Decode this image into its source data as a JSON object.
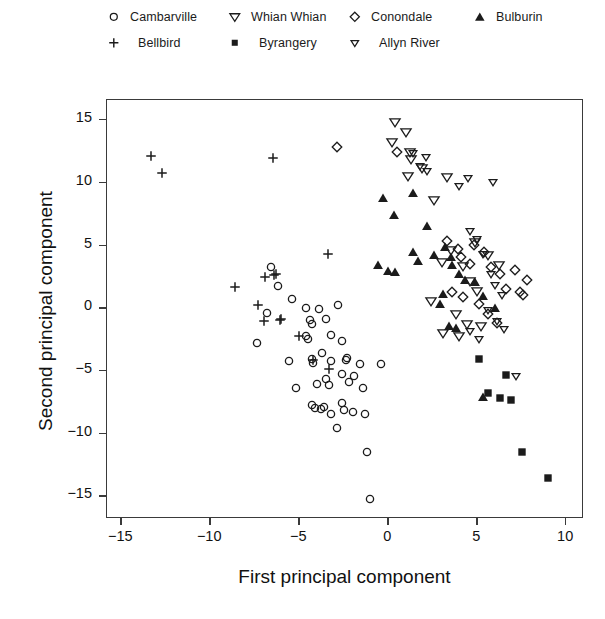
{
  "chart_data": {
    "type": "scatter",
    "title": "",
    "xlabel": "First principal component",
    "ylabel": "Second principal component",
    "xlim": [
      -15.8,
      11.0
    ],
    "ylim": [
      -16.8,
      16.6
    ],
    "xticks": [
      "-15",
      "-10",
      "-5",
      "0",
      "5",
      "10"
    ],
    "xtick_values": [
      -15,
      -10,
      -5,
      0,
      5,
      10
    ],
    "yticks": [
      "15",
      "10",
      "5",
      "0",
      "-5",
      "-10",
      "-15"
    ],
    "ytick_values": [
      15,
      10,
      5,
      0,
      -5,
      -10,
      -15
    ],
    "grid": false,
    "legend_position": "top",
    "series": [
      {
        "name": "Cambarville",
        "marker": "circle-open",
        "points": [
          [
            -6.6,
            3.1
          ],
          [
            -6.2,
            1.6
          ],
          [
            -5.4,
            0.6
          ],
          [
            -4.6,
            -0.1
          ],
          [
            -4.4,
            -1.1
          ],
          [
            -4.3,
            -1.4
          ],
          [
            -3.9,
            -0.2
          ],
          [
            -3.5,
            -1.0
          ],
          [
            -7.4,
            -2.9
          ],
          [
            -4.6,
            -2.4
          ],
          [
            -4.5,
            -2.6
          ],
          [
            -3.2,
            -2.3
          ],
          [
            -2.6,
            -2.8
          ],
          [
            -5.6,
            -4.4
          ],
          [
            -4.3,
            -4.2
          ],
          [
            -4.2,
            -4.5
          ],
          [
            -3.7,
            -3.7
          ],
          [
            -3.2,
            -4.4
          ],
          [
            -2.4,
            -4.3
          ],
          [
            -2.3,
            -4.1
          ],
          [
            -1.6,
            -4.6
          ],
          [
            -4.0,
            -6.2
          ],
          [
            -3.5,
            -5.8
          ],
          [
            -3.3,
            -6.3
          ],
          [
            -2.6,
            -5.4
          ],
          [
            -2.2,
            -6.0
          ],
          [
            -1.9,
            -5.6
          ],
          [
            -4.3,
            -7.9
          ],
          [
            -4.1,
            -8.1
          ],
          [
            -3.8,
            -8.2
          ],
          [
            -3.6,
            -8.0
          ],
          [
            -3.2,
            -8.6
          ],
          [
            -2.6,
            -7.7
          ],
          [
            -2.5,
            -8.3
          ],
          [
            -2.0,
            -8.4
          ],
          [
            -2.9,
            -9.7
          ],
          [
            -1.4,
            -6.5
          ],
          [
            -1.3,
            -8.6
          ],
          [
            -1.2,
            -11.6
          ],
          [
            -1.0,
            -15.4
          ],
          [
            -0.4,
            -4.6
          ],
          [
            -5.2,
            -6.5
          ],
          [
            -6.8,
            -0.5
          ],
          [
            -2.8,
            0.1
          ]
        ]
      },
      {
        "name": "Bellbird",
        "marker": "plus",
        "points": [
          [
            -13.3,
            12.0
          ],
          [
            -12.7,
            10.6
          ],
          [
            -6.5,
            11.8
          ],
          [
            -3.4,
            4.2
          ],
          [
            -8.6,
            1.5
          ],
          [
            -7.3,
            0.1
          ],
          [
            -6.9,
            2.3
          ],
          [
            -6.4,
            2.5
          ],
          [
            -6.3,
            2.6
          ],
          [
            -7.0,
            -1.2
          ],
          [
            -6.1,
            -1.1
          ],
          [
            -6.0,
            -1.0
          ],
          [
            -5.0,
            -2.4
          ],
          [
            -4.2,
            -4.3
          ],
          [
            -3.3,
            -5.0
          ]
        ]
      },
      {
        "name": "Whian Whian",
        "marker": "triangle-down-open-large",
        "points": [
          [
            0.4,
            14.7
          ],
          [
            0.2,
            13.1
          ],
          [
            1.0,
            13.9
          ],
          [
            1.2,
            12.3
          ],
          [
            1.3,
            11.7
          ],
          [
            1.1,
            10.4
          ],
          [
            1.9,
            11.0
          ],
          [
            3.3,
            10.3
          ],
          [
            2.6,
            8.5
          ],
          [
            3.5,
            4.5
          ],
          [
            3.0,
            3.5
          ],
          [
            4.2,
            3.2
          ],
          [
            4.6,
            2.0
          ],
          [
            5.0,
            1.2
          ],
          [
            2.4,
            0.4
          ],
          [
            3.8,
            -0.6
          ],
          [
            4.4,
            -1.4
          ],
          [
            5.2,
            -1.6
          ],
          [
            3.1,
            -2.1
          ],
          [
            4.0,
            -2.4
          ],
          [
            4.9,
            5.1
          ],
          [
            5.6,
            4.1
          ],
          [
            6.2,
            3.3
          ]
        ]
      },
      {
        "name": "Conondale",
        "marker": "diamond-open",
        "points": [
          [
            -2.9,
            12.7
          ],
          [
            0.5,
            12.3
          ],
          [
            3.3,
            5.2
          ],
          [
            3.9,
            4.6
          ],
          [
            4.1,
            3.9
          ],
          [
            4.6,
            3.4
          ],
          [
            5.4,
            4.3
          ],
          [
            5.8,
            3.1
          ],
          [
            6.3,
            2.6
          ],
          [
            6.6,
            1.4
          ],
          [
            7.1,
            2.9
          ],
          [
            7.4,
            1.1
          ],
          [
            7.6,
            0.9
          ],
          [
            7.8,
            2.1
          ],
          [
            5.1,
            0.2
          ],
          [
            5.6,
            -0.6
          ],
          [
            6.1,
            -1.3
          ],
          [
            4.2,
            0.7
          ],
          [
            3.6,
            1.1
          ],
          [
            4.8,
            4.9
          ]
        ]
      },
      {
        "name": "Bulburin",
        "marker": "triangle-up-filled",
        "points": [
          [
            -0.3,
            8.6
          ],
          [
            0.3,
            7.3
          ],
          [
            1.4,
            9.0
          ],
          [
            2.2,
            6.4
          ],
          [
            -0.6,
            3.3
          ],
          [
            0.0,
            2.8
          ],
          [
            0.4,
            2.7
          ],
          [
            2.6,
            4.1
          ],
          [
            3.2,
            4.7
          ],
          [
            3.5,
            3.9
          ],
          [
            3.6,
            3.3
          ],
          [
            4.0,
            2.6
          ],
          [
            4.3,
            2.1
          ],
          [
            4.9,
            1.9
          ],
          [
            5.3,
            0.8
          ],
          [
            6.0,
            -0.1
          ],
          [
            3.1,
            1.0
          ],
          [
            2.9,
            0.2
          ],
          [
            3.4,
            -1.6
          ],
          [
            3.8,
            -1.7
          ],
          [
            5.3,
            -7.2
          ],
          [
            1.4,
            4.3
          ],
          [
            1.7,
            3.6
          ]
        ]
      },
      {
        "name": "Allyn River",
        "marker": "triangle-down-open-small",
        "points": [
          [
            1.4,
            12.2
          ],
          [
            2.1,
            11.9
          ],
          [
            1.8,
            11.2
          ],
          [
            2.2,
            10.8
          ],
          [
            4.0,
            9.6
          ],
          [
            4.5,
            10.2
          ],
          [
            5.9,
            9.9
          ],
          [
            4.6,
            6.0
          ],
          [
            5.0,
            5.4
          ],
          [
            5.3,
            4.2
          ],
          [
            5.8,
            2.6
          ],
          [
            6.0,
            1.7
          ],
          [
            6.4,
            0.9
          ],
          [
            5.6,
            -0.3
          ],
          [
            6.1,
            -1.2
          ],
          [
            6.5,
            -1.8
          ],
          [
            4.6,
            -2.0
          ],
          [
            5.1,
            -2.6
          ],
          [
            7.2,
            -5.6
          ]
        ]
      },
      {
        "name": "Byrangery",
        "marker": "square-filled",
        "points": [
          [
            5.1,
            -4.2
          ],
          [
            6.6,
            -5.5
          ],
          [
            5.6,
            -6.9
          ],
          [
            6.3,
            -7.3
          ],
          [
            6.9,
            -7.5
          ],
          [
            7.5,
            -11.6
          ],
          [
            9.0,
            -13.7
          ]
        ]
      }
    ]
  },
  "legend": {
    "items": [
      {
        "label": "Cambarville",
        "marker": "circle-open"
      },
      {
        "label": "Whian Whian",
        "marker": "triangle-down-open-large"
      },
      {
        "label": "Conondale",
        "marker": "diamond-open"
      },
      {
        "label": "Bulburin",
        "marker": "triangle-up-filled"
      },
      {
        "label": "Bellbird",
        "marker": "plus"
      },
      {
        "label": "Byrangery",
        "marker": "square-filled"
      },
      {
        "label": "Allyn River",
        "marker": "triangle-down-open-small"
      }
    ]
  },
  "colors": {
    "marker": "#1b1b1b",
    "axis": "#3a3a3a",
    "text": "#111111",
    "background": "#ffffff"
  }
}
